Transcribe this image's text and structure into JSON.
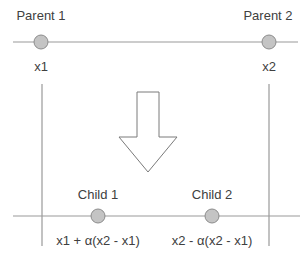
{
  "diagram": {
    "type": "crossover-illustration",
    "colors": {
      "line": "#999999",
      "node_fill": "#c4c4c4",
      "node_stroke": "#8c8c8c",
      "arrow_stroke": "#7a7a7a",
      "text": "#404040"
    },
    "parents": {
      "p1": {
        "label": "Parent 1",
        "value_label": "x1"
      },
      "p2": {
        "label": "Parent 2",
        "value_label": "x2"
      }
    },
    "children": {
      "c1": {
        "label": "Child 1",
        "formula": "x1 + α(x2 - x1)"
      },
      "c2": {
        "label": "Child 2",
        "formula": "x2 - α(x2 - x1)"
      }
    },
    "arrow": {
      "direction": "down",
      "icon": "down-arrow-icon"
    }
  }
}
